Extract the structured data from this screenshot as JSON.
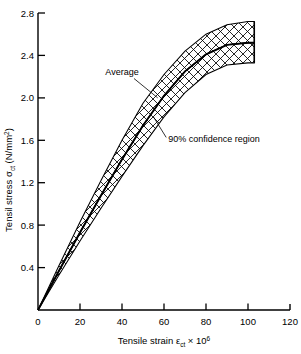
{
  "chart_data": {
    "type": "area",
    "title": "",
    "subtitle": "",
    "xlabel_parts": {
      "main": "Tensile strain ",
      "symbol": "ε",
      "sub": "ct",
      "times": " × 10",
      "sup": "6"
    },
    "ylabel_parts": {
      "main": "Tensil stress ",
      "symbol": "σ",
      "sub": "ct",
      "unit": " (N/mm",
      "sup": "2",
      "close": ")"
    },
    "xlabel": "Tensile strain εct × 10⁶",
    "ylabel": "Tensil stress σct (N/mm²)",
    "xlim": [
      0,
      120
    ],
    "ylim": [
      0,
      2.8
    ],
    "xticks": [
      "0",
      "20",
      "40",
      "60",
      "80",
      "100",
      "120"
    ],
    "xtick_values": [
      0,
      20,
      40,
      60,
      80,
      100,
      120
    ],
    "yticks": [
      "0.4",
      "0.8",
      "1.2",
      "1.6",
      "2.0",
      "2.4",
      "2.8"
    ],
    "ytick_values": [
      0.4,
      0.8,
      1.2,
      1.6,
      2.0,
      2.4,
      2.8
    ],
    "grid": false,
    "legend_position": "none",
    "x": [
      0,
      10,
      20,
      30,
      40,
      50,
      60,
      70,
      80,
      90,
      100,
      103
    ],
    "series": [
      {
        "name": "Upper 90% confidence bound",
        "values": [
          0,
          0.42,
          0.83,
          1.22,
          1.6,
          1.95,
          2.22,
          2.44,
          2.6,
          2.69,
          2.72,
          2.72
        ]
      },
      {
        "name": "Average",
        "values": [
          0,
          0.37,
          0.73,
          1.08,
          1.42,
          1.74,
          2.02,
          2.25,
          2.41,
          2.5,
          2.52,
          2.52
        ]
      },
      {
        "name": "Lower 90% confidence bound",
        "values": [
          0,
          0.33,
          0.65,
          0.96,
          1.26,
          1.55,
          1.82,
          2.05,
          2.22,
          2.31,
          2.33,
          2.33
        ]
      }
    ],
    "annotations": [
      {
        "label": "Average",
        "x": 40,
        "y": 2.22,
        "points_to_x": 57,
        "points_to_y": 2.0
      },
      {
        "label": "90% confidence region",
        "x": 62,
        "y": 1.58,
        "points_to_x": 55,
        "points_to_y": 1.82
      }
    ],
    "band": {
      "name": "90% confidence region",
      "fill": "crosshatch",
      "line_color": "#000000"
    },
    "colors": {
      "ink": "#000000",
      "background": "#ffffff"
    }
  }
}
